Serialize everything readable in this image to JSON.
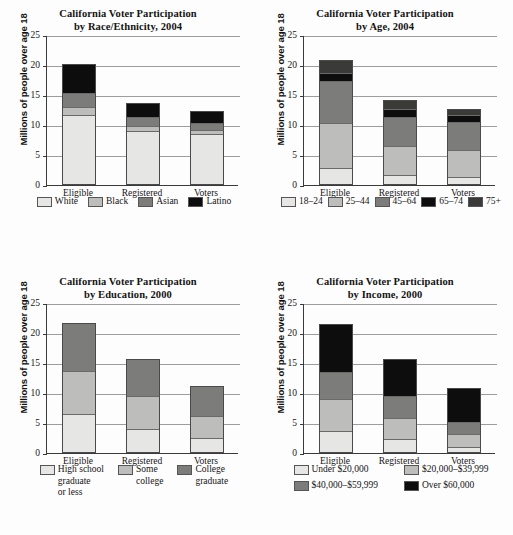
{
  "page": {
    "background": "#fdfdfd",
    "ylabel": "Millions of people over age 18",
    "y_ticks": [
      "25",
      "20",
      "15",
      "10",
      "5",
      "0"
    ],
    "categories": [
      "Eligible",
      "Registered",
      "Voters"
    ]
  },
  "colors": {
    "shade1": "#e6e6e4",
    "shade2": "#bdbdbb",
    "shade3": "#7c7c7a",
    "shade4": "#0d0d0d",
    "shade5": "#3a3a38",
    "axis": "#3a3a3a",
    "grid": "#9d9d9d"
  },
  "chart_data": [
    {
      "id": "race-ethnicity-2004",
      "type": "bar",
      "stacked": true,
      "title": "California Voter Participation",
      "subtitle": "by Race/Ethnicity, 2004",
      "title_line1": "California Voter Participation",
      "title_line2": "by Race/Ethnicity, 2004",
      "xlabel": "",
      "ylabel": "Millions of people over age 18",
      "ylim": [
        0,
        25
      ],
      "yticks": [
        0,
        5,
        10,
        15,
        20,
        25
      ],
      "grid": true,
      "legend_position": "bottom",
      "categories": [
        "Eligible",
        "Registered",
        "Voters"
      ],
      "series": [
        {
          "name": "White",
          "color": "#e6e6e4",
          "values": [
            11.6,
            8.9,
            8.4
          ]
        },
        {
          "name": "Black",
          "color": "#bdbdbb",
          "values": [
            1.2,
            0.8,
            0.6
          ]
        },
        {
          "name": "Asian",
          "color": "#7c7c7a",
          "values": [
            2.4,
            1.5,
            1.3
          ]
        },
        {
          "name": "Latino",
          "color": "#0d0d0d",
          "values": [
            5.0,
            2.5,
            2.1
          ]
        }
      ],
      "totals": [
        20.2,
        13.7,
        12.4
      ]
    },
    {
      "id": "age-2004",
      "type": "bar",
      "stacked": true,
      "title": "California Voter Participation",
      "subtitle": "by Age, 2004",
      "title_line1": "California Voter Participation",
      "title_line2": "by Age, 2004",
      "xlabel": "",
      "ylabel": "Millions of people over age 18",
      "ylim": [
        0,
        25
      ],
      "yticks": [
        0,
        5,
        10,
        15,
        20,
        25
      ],
      "grid": true,
      "legend_position": "bottom",
      "categories": [
        "Eligible",
        "Registered",
        "Voters"
      ],
      "series": [
        {
          "name": "18–24",
          "color": "#e6e6e4",
          "values": [
            2.5,
            1.4,
            1.1
          ]
        },
        {
          "name": "25–44",
          "color": "#bdbdbb",
          "values": [
            7.6,
            5.0,
            4.5
          ]
        },
        {
          "name": "45–64",
          "color": "#7c7c7a",
          "values": [
            7.1,
            4.9,
            4.8
          ]
        },
        {
          "name": "65–74",
          "color": "#0d0d0d",
          "values": [
            1.5,
            1.3,
            1.2
          ]
        },
        {
          "name": "75+",
          "color": "#3a3a38",
          "values": [
            2.1,
            1.6,
            1.1
          ]
        }
      ],
      "totals": [
        20.8,
        14.2,
        12.7
      ]
    },
    {
      "id": "education-2000",
      "type": "bar",
      "stacked": true,
      "title": "California Voter Participation",
      "subtitle": "by Education, 2000",
      "title_line1": "California Voter Participation",
      "title_line2": "by Education, 2000",
      "xlabel": "",
      "ylabel": "Millions of people over age 18",
      "ylim": [
        0,
        25
      ],
      "yticks": [
        0,
        5,
        10,
        15,
        20,
        25
      ],
      "grid": true,
      "legend_position": "bottom",
      "categories": [
        "Eligible",
        "Registered",
        "Voters"
      ],
      "series": [
        {
          "name": "High school\ngraduate\nor less",
          "color": "#e6e6e4",
          "values": [
            6.3,
            3.7,
            2.3
          ]
        },
        {
          "name": "Some\ncollege",
          "color": "#bdbdbb",
          "values": [
            7.2,
            5.6,
            3.7
          ]
        },
        {
          "name": "College\ngraduate",
          "color": "#7c7c7a",
          "values": [
            8.1,
            6.4,
            5.1
          ]
        }
      ],
      "totals": [
        21.6,
        15.7,
        11.1
      ]
    },
    {
      "id": "income-2000",
      "type": "bar",
      "stacked": true,
      "title": "California Voter Participation",
      "subtitle": "by Income, 2000",
      "title_line1": "California Voter Participation",
      "title_line2": "by Income, 2000",
      "xlabel": "",
      "ylabel": "Millions of people over age 18",
      "ylim": [
        0,
        25
      ],
      "yticks": [
        0,
        5,
        10,
        15,
        20,
        25
      ],
      "grid": true,
      "legend_position": "bottom",
      "categories": [
        "Eligible",
        "Registered",
        "Voters"
      ],
      "series": [
        {
          "name": "Under $20,000",
          "color": "#e6e6e4",
          "values": [
            3.4,
            2.0,
            0.7
          ]
        },
        {
          "name": "$20,000–$39,999",
          "color": "#bdbdbb",
          "values": [
            5.4,
            3.7,
            2.2
          ]
        },
        {
          "name": "$40,000–$59,999",
          "color": "#7c7c7a",
          "values": [
            4.5,
            3.7,
            2.1
          ]
        },
        {
          "name": "Over $60,000",
          "color": "#0d0d0d",
          "values": [
            8.2,
            6.2,
            5.9
          ]
        }
      ],
      "totals": [
        21.5,
        15.6,
        10.9
      ]
    }
  ]
}
